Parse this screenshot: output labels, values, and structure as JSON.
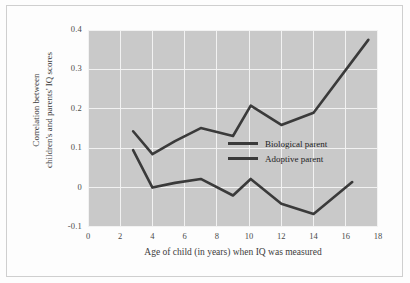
{
  "chart_data": {
    "type": "line",
    "title": "",
    "xlabel": "Age of child (in years) when IQ was measured",
    "ylabel_lines": [
      "Correlation between",
      "children's and parents' IQ scores"
    ],
    "ylabel": "Correlation between children's and parents' IQ scores",
    "xlim": [
      0,
      18
    ],
    "ylim": [
      -0.1,
      0.4
    ],
    "xticks": [
      "0",
      "2",
      "4",
      "6",
      "8",
      "10",
      "12",
      "14",
      "16",
      "18"
    ],
    "xtick_values": [
      0,
      2,
      4,
      6,
      8,
      10,
      12,
      14,
      16,
      18
    ],
    "yticks": [
      "0.4",
      "0.3",
      "0.2",
      "0.1",
      "0",
      "-0.1"
    ],
    "ytick_values": [
      0.4,
      0.3,
      0.2,
      0.1,
      0,
      -0.1
    ],
    "grid": true,
    "grid_color": "#f2f2f2",
    "plot_background": "#c9c9c9",
    "line_color": "#3a3a3a",
    "legend_position": "center-right",
    "series": [
      {
        "name": "Biological parent",
        "x": [
          2.8,
          4.0,
          5.4,
          7.0,
          9.0,
          10.1,
          12.0,
          14.0,
          17.4
        ],
        "y": [
          0.143,
          0.085,
          0.118,
          0.151,
          0.131,
          0.208,
          0.159,
          0.19,
          0.375
        ]
      },
      {
        "name": "Adoptive parent",
        "x": [
          2.8,
          4.0,
          5.4,
          7.0,
          9.0,
          10.1,
          12.0,
          14.0,
          16.4
        ],
        "y": [
          0.095,
          0.0,
          0.012,
          0.022,
          -0.02,
          0.022,
          -0.041,
          -0.067,
          0.014
        ]
      }
    ]
  },
  "legend": {
    "items": [
      {
        "label": "Biological parent"
      },
      {
        "label": "Adoptive parent"
      }
    ]
  }
}
